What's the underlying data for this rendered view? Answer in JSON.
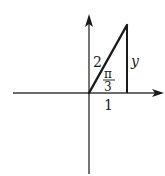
{
  "diagram": {
    "type": "right-triangle-on-axes",
    "labels": {
      "hypotenuse": "2",
      "angle_num": "π",
      "angle_den": "3",
      "adjacent": "1",
      "opposite": "y"
    },
    "colors": {
      "stroke": "#1a1a1a",
      "axis": "#3a3a3a",
      "background": "#ffffff"
    }
  }
}
